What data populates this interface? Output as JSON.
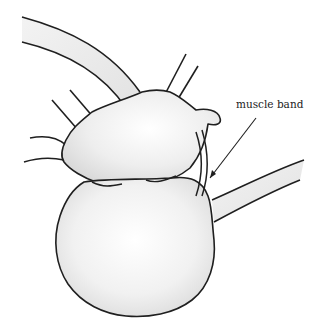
{
  "diagram": {
    "type": "anatomical-illustration",
    "labels": [
      {
        "text": "muscle band",
        "x": 236,
        "y": 98
      }
    ],
    "colors": {
      "outline": "#1f1f1f",
      "fill": "#e9e9e9",
      "highlight": "#ffffff",
      "background": "#ffffff"
    }
  }
}
